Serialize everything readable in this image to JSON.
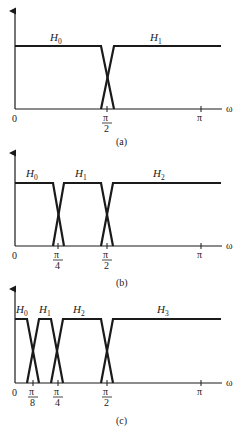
{
  "figure": {
    "axis_variable": "ω",
    "origin_label": "0",
    "pi_label": "π",
    "colors": {
      "line": "#1a1a1a",
      "background": "#ffffff"
    }
  },
  "panels": [
    {
      "caption": "(a)",
      "filters": [
        {
          "name": "H",
          "sub": "0"
        },
        {
          "name": "H",
          "sub": "1"
        }
      ],
      "ticks": [
        {
          "num": "π",
          "den": "2"
        }
      ],
      "band_edges": [
        "π/2"
      ]
    },
    {
      "caption": "(b)",
      "filters": [
        {
          "name": "H",
          "sub": "0"
        },
        {
          "name": "H",
          "sub": "1"
        },
        {
          "name": "H",
          "sub": "2"
        }
      ],
      "ticks": [
        {
          "num": "π",
          "den": "4"
        },
        {
          "num": "π",
          "den": "2"
        }
      ],
      "band_edges": [
        "π/4",
        "π/2"
      ]
    },
    {
      "caption": "(c)",
      "filters": [
        {
          "name": "H",
          "sub": "0"
        },
        {
          "name": "H",
          "sub": "1"
        },
        {
          "name": "H",
          "sub": "2"
        },
        {
          "name": "H",
          "sub": "3"
        }
      ],
      "ticks": [
        {
          "num": "π",
          "den": "8"
        },
        {
          "num": "π",
          "den": "4"
        },
        {
          "num": "π",
          "den": "2"
        }
      ],
      "band_edges": [
        "π/8",
        "π/4",
        "π/2"
      ]
    }
  ]
}
